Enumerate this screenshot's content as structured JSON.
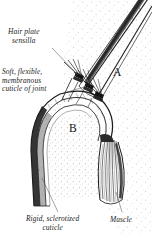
{
  "figure": {
    "type": "scientific-line-illustration",
    "background_color": "#ffffff",
    "ink_color": "#1b1b1b",
    "stipple_color": "#b9b9b9"
  },
  "labels": {
    "hair_plate": {
      "line1": "Hair plate",
      "line2": "sensilla"
    },
    "soft_cuticle": {
      "line1": "Soft, flexible,",
      "line2": "membranous",
      "line3": "cuticle of joint"
    },
    "rigid_cuticle": {
      "line1": "Rigid, sclerotized",
      "line2": "cuticle"
    },
    "muscle": {
      "line1": "Muscle"
    }
  },
  "callouts": {
    "segment_a": "A",
    "segment_b": "B"
  }
}
